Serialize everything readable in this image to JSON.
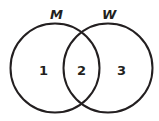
{
  "diagram": {
    "type": "venn",
    "sets": [
      {
        "label": "M",
        "cx": 55,
        "cy": 68,
        "r": 44.5
      },
      {
        "label": "W",
        "cx": 108,
        "cy": 68,
        "r": 44.5
      }
    ],
    "regions": [
      {
        "label": "1",
        "x": 43,
        "y": 75
      },
      {
        "label": "2",
        "x": 81,
        "y": 75
      },
      {
        "label": "3",
        "x": 121,
        "y": 75
      }
    ],
    "stroke_color": "#231f20"
  }
}
